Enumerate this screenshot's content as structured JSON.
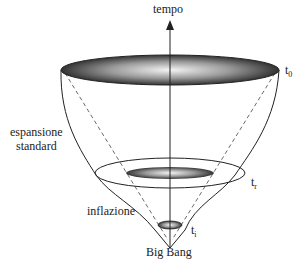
{
  "diagram": {
    "type": "inflationary-universe-cone",
    "axis_label": "tempo",
    "labels": {
      "t0": {
        "base": "t",
        "sub": "0"
      },
      "tr": {
        "base": "t",
        "sub": "r"
      },
      "ti": {
        "base": "t",
        "sub": "i"
      },
      "standard_expansion": [
        "espansione",
        "standard"
      ],
      "inflation": "inflazione",
      "big_bang": "Big Bang"
    },
    "colors": {
      "line": "#222222",
      "disk_dark": "#3a3a3a",
      "disk_light": "#f0f0f0",
      "background": "#ffffff"
    }
  }
}
